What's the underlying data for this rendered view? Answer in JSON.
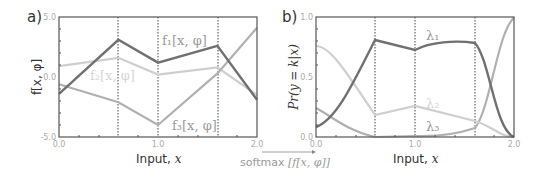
{
  "chart_data": [
    {
      "panel": "a)",
      "type": "line",
      "title": "",
      "xlabel": "Input, x",
      "ylabel": "f[x, φ]",
      "xlim": [
        0.0,
        2.0
      ],
      "ylim": [
        -5.0,
        5.0
      ],
      "x_ticks": [
        "0.0",
        "1.0",
        "2.0"
      ],
      "y_ticks": [
        "5.0",
        "0.0",
        "-5.0"
      ],
      "breakpoints": [
        0.6,
        1.0,
        1.6
      ],
      "x": [
        0.0,
        0.6,
        1.0,
        1.6,
        2.0
      ],
      "series": [
        {
          "name": "f1[x, φ]",
          "color": "#707070",
          "values": [
            -1.4,
            3.1,
            1.2,
            2.6,
            -1.9
          ]
        },
        {
          "name": "f2[x, φ]",
          "color": "#cfcfcf",
          "values": [
            0.9,
            1.6,
            0.2,
            0.8,
            -1.5
          ]
        },
        {
          "name": "f3[x, φ]",
          "color": "#b0b0b0",
          "values": [
            -0.6,
            -2.1,
            -4.0,
            0.3,
            4.1
          ]
        }
      ],
      "grid": false,
      "legend": "inline labels"
    },
    {
      "panel": "b)",
      "type": "line",
      "title": "",
      "xlabel": "Input, x",
      "ylabel": "Pr(y = k|x)",
      "xlim": [
        0.0,
        2.0
      ],
      "ylim": [
        0.0,
        1.0
      ],
      "x_ticks": [
        "0.0",
        "1.0",
        "2.0"
      ],
      "y_ticks": [
        "1.0",
        "0.5",
        "0.0"
      ],
      "breakpoints": [
        0.6,
        1.0,
        1.6
      ],
      "x": [
        0.0,
        0.2,
        0.4,
        0.6,
        0.8,
        1.0,
        1.2,
        1.4,
        1.6,
        1.7,
        1.8,
        1.9,
        2.0
      ],
      "series": [
        {
          "name": "λ1",
          "color": "#707070",
          "values": [
            0.08,
            0.3,
            0.6,
            0.81,
            0.77,
            0.73,
            0.77,
            0.79,
            0.78,
            0.5,
            0.15,
            0.03,
            0.01
          ]
        },
        {
          "name": "λ2",
          "color": "#cfcfcf",
          "values": [
            0.76,
            0.65,
            0.42,
            0.18,
            0.22,
            0.26,
            0.22,
            0.18,
            0.13,
            0.1,
            0.05,
            0.01,
            0.0
          ]
        },
        {
          "name": "λ3",
          "color": "#b0b0b0",
          "values": [
            0.16,
            0.05,
            0.01,
            0.0,
            0.0,
            0.01,
            0.01,
            0.03,
            0.08,
            0.4,
            0.8,
            0.96,
            0.99
          ]
        }
      ],
      "grid": false,
      "legend": "inline labels"
    }
  ],
  "labels": {
    "panel_a": "a)",
    "panel_b": "b)",
    "xlabel": "Input, ",
    "xvar": "x",
    "arrow_label_pre": "softmax ",
    "arrow_label_math": "[f[x, φ]]",
    "f1": "f₁[x, φ]",
    "f2": "f₂[x, φ]",
    "f3": "f₃[x, φ]",
    "l1": "λ₁",
    "l2": "λ₂",
    "l3": "λ₃",
    "ylabel_a": "f[x, φ]",
    "ylabel_b": "Pr(y = k|x)",
    "ticks": {
      "a_y_top": "5.0",
      "a_y_mid": "0.0",
      "a_y_bot": "-5.0",
      "b_y_top": "1.0",
      "b_y_mid": "0.5",
      "b_y_bot": "0.0",
      "x0": "0.0",
      "x1": "1.0",
      "x2": "2.0"
    }
  }
}
